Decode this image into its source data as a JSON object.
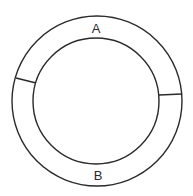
{
  "diagram": {
    "type": "annular-ring-divided",
    "outer_circle": {
      "cx": 97,
      "cy": 101,
      "r": 85
    },
    "inner_circle": {
      "cx": 96,
      "cy": 101,
      "r": 63
    },
    "separators": [
      {
        "x1": 16,
        "y1": 78,
        "x2": 36,
        "y2": 83
      },
      {
        "x1": 159,
        "y1": 95,
        "x2": 182,
        "y2": 94
      }
    ],
    "regions": [
      {
        "label": "A",
        "x": 96,
        "y": 33
      },
      {
        "label": "B",
        "x": 98,
        "y": 180
      }
    ],
    "stroke_color": "#2a2a2a",
    "background": "#ffffff"
  }
}
